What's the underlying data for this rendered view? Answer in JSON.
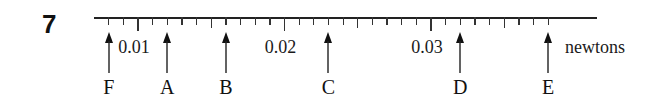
{
  "question": {
    "number": "7"
  },
  "scale": {
    "unit": "newtons",
    "line": {
      "x_start": 94,
      "x_end": 597,
      "y": 17
    },
    "origin_value": 0.01,
    "origin_x": 138,
    "px_per_thousandth": 14.65,
    "minor_step": 0.001,
    "first_tick_value": 0.008,
    "last_tick_value": 0.038,
    "labeled_values": [
      {
        "value": 0.01,
        "text": "0.01"
      },
      {
        "value": 0.02,
        "text": "0.02"
      },
      {
        "value": 0.03,
        "text": "0.03"
      }
    ]
  },
  "markers": [
    {
      "label": "F",
      "value": 0.008
    },
    {
      "label": "A",
      "value": 0.012
    },
    {
      "label": "B",
      "value": 0.016
    },
    {
      "label": "C",
      "value": 0.023
    },
    {
      "label": "D",
      "value": 0.032
    },
    {
      "label": "E",
      "value": 0.038
    }
  ],
  "colors": {
    "ink": "#1a1a1a",
    "background": "#ffffff"
  }
}
